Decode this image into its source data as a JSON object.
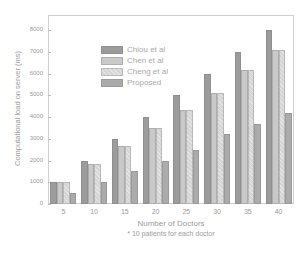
{
  "chart_data": {
    "type": "bar",
    "title": "",
    "xlabel": "Number of Doctors",
    "xlabel_note": "* 10 patients for each doctor",
    "ylabel": "Computational load on server (ms)",
    "ylim": [
      0,
      8700
    ],
    "yticks": [
      0,
      1000,
      2000,
      3000,
      4000,
      5000,
      6000,
      7000,
      8000
    ],
    "categories": [
      "5",
      "10",
      "15",
      "20",
      "25",
      "30",
      "35",
      "40"
    ],
    "series": [
      {
        "name": "Chiou et al",
        "color": "#9c9c9c",
        "values": [
          1000,
          2000,
          3000,
          4000,
          5000,
          6000,
          7000,
          8000
        ]
      },
      {
        "name": "Chen et al",
        "color": "#c9c9c9",
        "values": [
          1000,
          1850,
          2650,
          3500,
          4350,
          5100,
          6150,
          7100
        ]
      },
      {
        "name": "Cheng et al",
        "color": "#d6d6d6",
        "values": [
          1000,
          1850,
          2650,
          3500,
          4350,
          5100,
          6150,
          7100
        ]
      },
      {
        "name": "Proposed",
        "color": "#ababab",
        "values": [
          500,
          1000,
          1500,
          2000,
          2500,
          3200,
          3700,
          4200
        ]
      }
    ],
    "legend_position": "upper-left-inside",
    "grid": false
  }
}
